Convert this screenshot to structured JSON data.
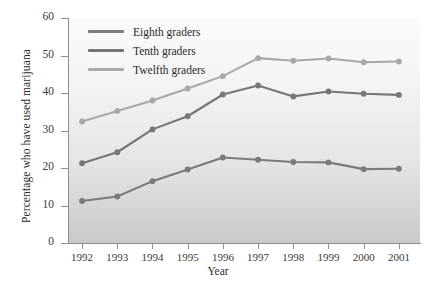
{
  "chart_data": {
    "type": "line",
    "title": "",
    "xlabel": "Year",
    "ylabel": "Percentage who have used marijuana",
    "categories": [
      "1992",
      "1993",
      "1994",
      "1995",
      "1996",
      "1997",
      "1998",
      "1999",
      "2000",
      "2001"
    ],
    "x": [
      1992,
      1993,
      1994,
      1995,
      1996,
      1997,
      1998,
      1999,
      2000,
      2001
    ],
    "xlim": [
      1991.6,
      2001.6
    ],
    "ylim": [
      0,
      60
    ],
    "yticks": [
      0,
      10,
      20,
      30,
      40,
      50,
      60
    ],
    "grid": false,
    "legend_position": "upper-left-inside",
    "markers": "circle",
    "series": [
      {
        "name": "Eighth graders",
        "color": "#7a7a7a",
        "values": [
          11.2,
          12.4,
          16.5,
          19.6,
          22.8,
          22.2,
          21.6,
          21.5,
          19.7,
          19.8
        ]
      },
      {
        "name": "Tenth graders",
        "color": "#767676",
        "values": [
          21.3,
          24.2,
          30.3,
          33.8,
          39.6,
          42.0,
          39.1,
          40.4,
          39.8,
          39.5
        ]
      },
      {
        "name": "Twelfth graders",
        "color": "#a8a8a8",
        "values": [
          32.4,
          35.2,
          38.0,
          41.2,
          44.5,
          49.3,
          48.6,
          49.2,
          48.2,
          48.4
        ]
      }
    ]
  }
}
